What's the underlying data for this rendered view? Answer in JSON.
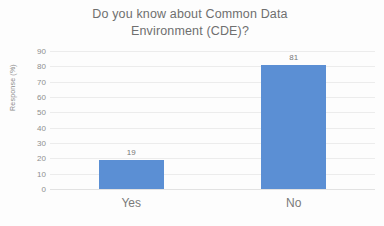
{
  "chart_data": {
    "type": "bar",
    "title": "Do you know about Common Data\nEnvironment (CDE)?",
    "categories": [
      "Yes",
      "No"
    ],
    "values": [
      19,
      81
    ],
    "xlabel": "",
    "ylabel": "Response (%)",
    "ylim": [
      0,
      90
    ],
    "ytick_step": 10,
    "yticks": [
      90,
      80,
      70,
      60,
      50,
      40,
      30,
      20,
      10,
      0
    ],
    "data_labels": [
      "19",
      "81"
    ],
    "grid": true,
    "legend": false,
    "bar_color": "#5b8fd4",
    "title_color": "#6f6f6f",
    "tick_color": "#8f8f8f",
    "gridline_color": "#ececec"
  }
}
